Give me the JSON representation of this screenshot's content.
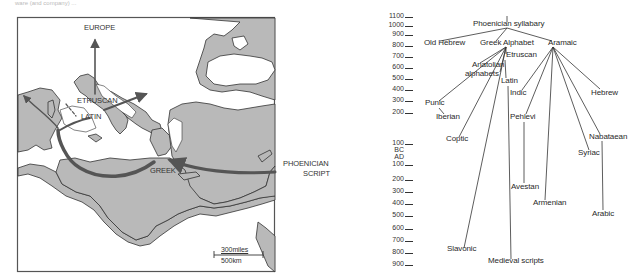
{
  "caption_fragment": "ware (and company) ...",
  "map": {
    "title": "Spread of the alphabet from Phoenicia",
    "labels": {
      "europe": "EUROPE",
      "etruscan": "ETRUSCAN",
      "latin": "LATIN",
      "greek": "GREEK",
      "phoenician_line1": "PHOENICIAN",
      "phoenician_line2": "SCRIPT"
    },
    "scale": {
      "miles": "300miles",
      "km": "500km"
    },
    "colors": {
      "land": "#b9b9b9",
      "sea": "#ffffff",
      "coast": "#333333",
      "arrow": "#555555",
      "frame": "#555555"
    }
  },
  "timeline": {
    "bc_ticks": [
      "1100",
      "1000",
      "900",
      "800",
      "700",
      "600",
      "500",
      "400",
      "300",
      "200",
      "100"
    ],
    "era_bc": "BC",
    "era_ad": "AD",
    "ad_ticks": [
      "100",
      "200",
      "300",
      "400",
      "500",
      "600",
      "700",
      "800",
      "900"
    ]
  },
  "tree": {
    "root": "Phoenician syllabary",
    "nodes": {
      "old_hebrew": "Old Hebrew",
      "greek_alphabet": "Greek Alphabet",
      "aramaic": "Aramaic",
      "etruscan": "Etruscan",
      "anatolian1": "Anatolian",
      "anatolian2": "alphabets",
      "latin": "Latin",
      "indic": "Indic",
      "hebrew": "Hebrew",
      "punic": "Punic",
      "iberian": "Iberian",
      "pehlevi": "Pehlevi",
      "coptic": "Coptic",
      "nabataean": "Nabataean",
      "syriac": "Syriac",
      "avestan": "Avestan",
      "armenian": "Armenian",
      "arabic": "Arabic",
      "slavonic": "Slavonic",
      "medieval": "Medieval scripts"
    }
  }
}
